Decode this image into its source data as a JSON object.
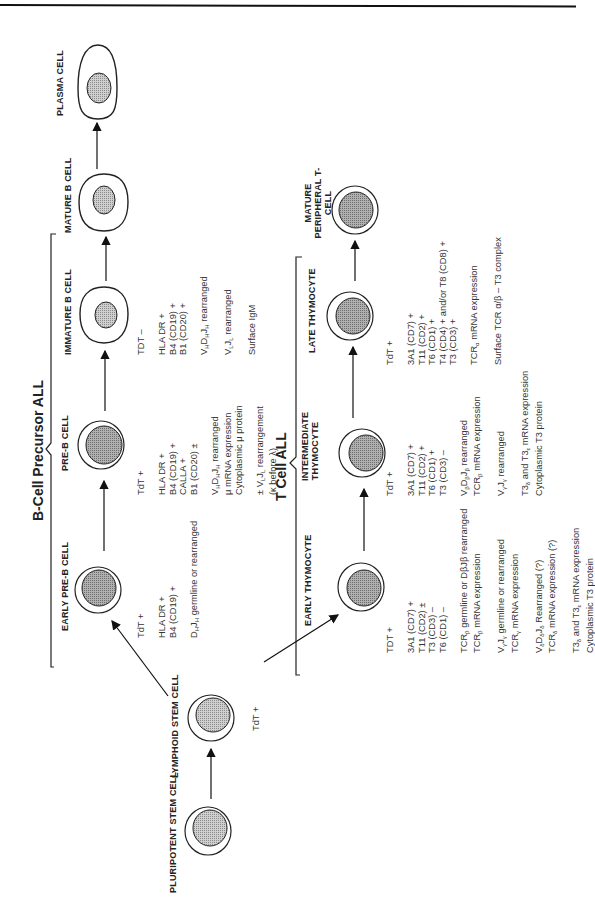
{
  "headers": {
    "b_cell": "B-Cell Precursor ALL",
    "t_cell": "T Cell ALL"
  },
  "stem": {
    "pluripotent": "PLURIPOTENT STEM CELL",
    "lymphoid": "LYMPHOID STEM CELL",
    "lymphoid_to_t_marker": "TdT +"
  },
  "b_cells": [
    {
      "label": "EARLY PRE-B CELL",
      "markers": [
        "TdT +",
        "",
        "HLA DR +",
        "B4 (CD19) +",
        "",
        "DHJH germline or rearranged"
      ]
    },
    {
      "label": "PRE-B CELL",
      "markers": [
        "TdT +",
        "",
        "HLA DR +",
        "B4 (CD19) +",
        "CALLA +",
        "B1 (CD20) ±",
        "",
        "VHDHJH rearranged",
        "μ mRNA expression",
        "Cytoplasmic μ protein",
        "",
        "± VLJL rearrangement",
        "   (κ before λ)"
      ]
    },
    {
      "label": "IMMATURE B CELL",
      "markers": [
        "TDT –",
        "",
        "HLA DR +",
        "B4 (CD19) +",
        "B1 (CD20) +",
        "",
        "VHDHJH rearranged",
        "",
        "VLJL rearranged",
        "",
        "Surface IgM"
      ]
    },
    {
      "label": "MATURE B CELL",
      "markers": []
    },
    {
      "label": "PLASMA CELL",
      "markers": []
    }
  ],
  "t_cells": [
    {
      "label": "EARLY THYMOCYTE",
      "markers": [
        "TDT +",
        "",
        "3A1 (CD7) +",
        "T11 (CD2) ±",
        "T3   (CD3) –",
        "T6   (CD1) –",
        "",
        "TCRβ germline or DβJβ rearranged",
        "TCRβ mRNA expression",
        "",
        "VγJγ germline or rearranged",
        "TCRγ mRNA expression",
        "",
        "VδDδJδ Rearranged (?)",
        "TCRδ mRNA expression (?)",
        "",
        "T3δ and T3ε mRNA expression",
        "Cytoplasmic T3 protein"
      ]
    },
    {
      "label": "INTERMEDIATE THYMOCYTE",
      "markers": [
        "TdT +",
        "",
        "3A1 (CD7) +",
        "T11 (CD2) +",
        "T6   (CD1) +",
        "T3   (CD3) –",
        "",
        "VβDβJβ rearranged",
        "TCRβ mRNA expression",
        "",
        "VγJγ rearranged",
        "",
        "T3δ and T3ε mRNA expression",
        "Cytoplasmic T3 protein"
      ]
    },
    {
      "label": "LATE THYMOCYTE",
      "markers": [
        "TdT +",
        "",
        "3A1   (CD7) +",
        "T11   (CD2) +",
        "T6     (CD1) +",
        "T4     (CD4) +  and/or T8 (CD8) +",
        "T3     (CD3) +",
        "",
        "TCRα mRNA expression",
        "",
        "Surface TCR α/β – T3 complex"
      ]
    },
    {
      "label": "MATURE PERIPHERAL T-CELL",
      "markers": []
    }
  ],
  "colors": {
    "ink": "#222222",
    "nucleus_fill": "#bdbdbd",
    "nucleus_fill_dark": "#9e9e9e",
    "stem_nucleus_fill": "#d2d2d2"
  }
}
